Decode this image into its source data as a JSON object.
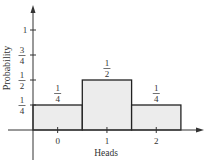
{
  "chart_data": {
    "type": "bar",
    "title": "",
    "xlabel": "Heads",
    "ylabel": "Probability",
    "categories": [
      "0",
      "1",
      "2"
    ],
    "values": [
      0.25,
      0.5,
      0.25
    ],
    "value_labels": [
      {
        "num": "1",
        "den": "4"
      },
      {
        "num": "1",
        "den": "2"
      },
      {
        "num": "1",
        "den": "4"
      }
    ],
    "ylim": [
      0,
      1.2
    ],
    "yticks": [
      {
        "value": 0.25,
        "num": "1",
        "den": "4"
      },
      {
        "value": 0.5,
        "num": "1",
        "den": "2"
      },
      {
        "value": 0.75,
        "num": "3",
        "den": "4"
      },
      {
        "value": 1,
        "label": "1"
      }
    ],
    "grid": false,
    "bar_fill": "#ececec",
    "bar_edge": "#222222"
  }
}
